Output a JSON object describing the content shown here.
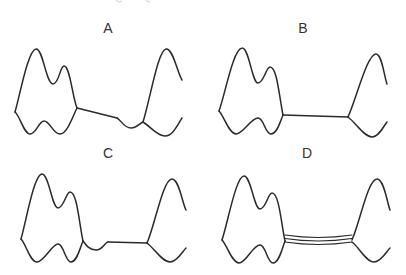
{
  "figure": {
    "colors": {
      "background": "#ffffff",
      "line": "#2a2a2a",
      "label": "#333333"
    },
    "panels": [
      {
        "id": "A",
        "label": "A",
        "connector": "single sloped line descending to a small dip before the right profile"
      },
      {
        "id": "B",
        "label": "B",
        "connector": "single straight horizontal line between profiles"
      },
      {
        "id": "C",
        "label": "C",
        "connector": "small curved dip followed by a straight horizontal line"
      },
      {
        "id": "D",
        "label": "D",
        "connector": "three parallel gently curved lines between profiles"
      }
    ]
  }
}
